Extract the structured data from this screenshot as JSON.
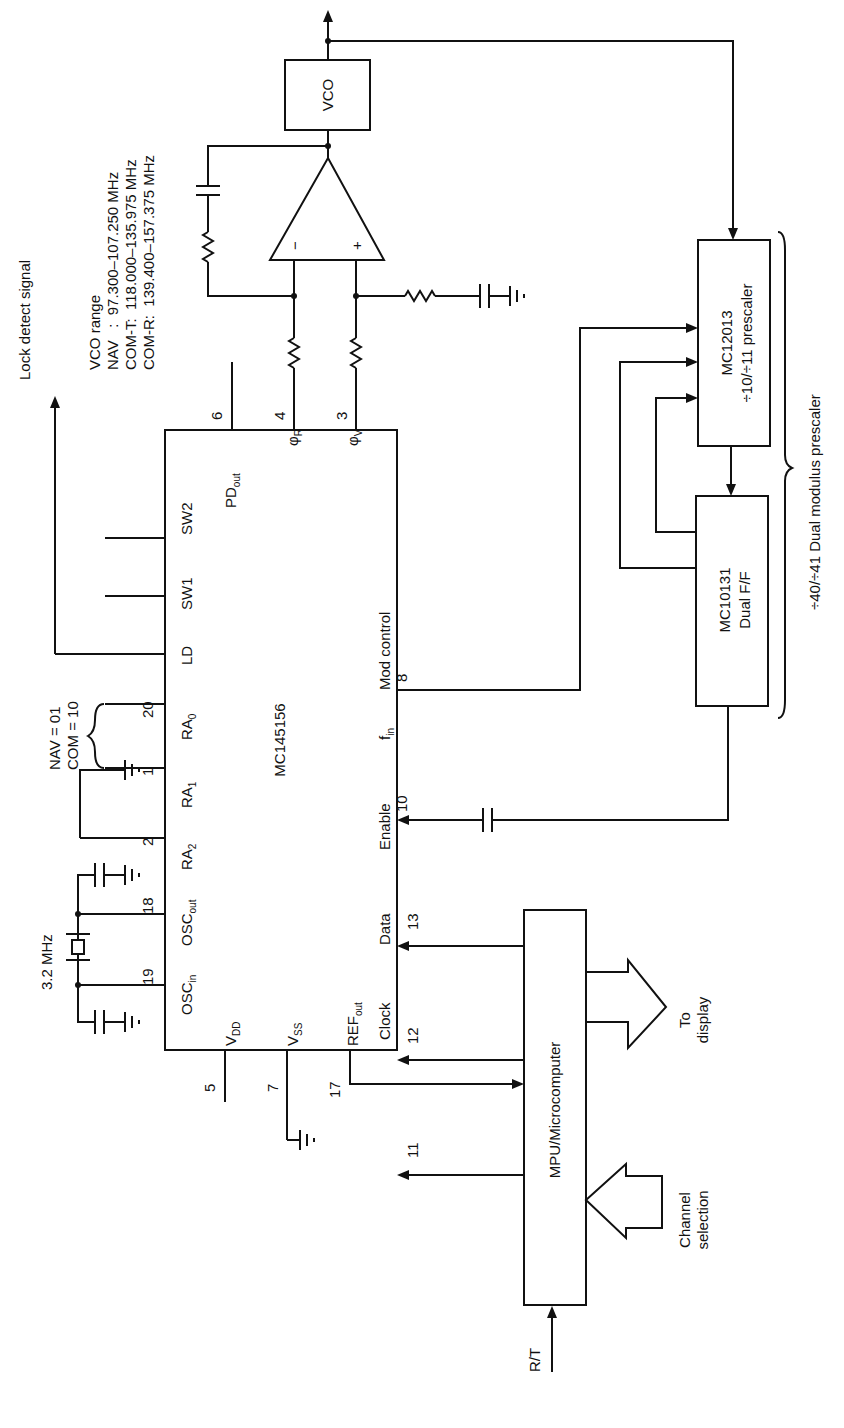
{
  "vco_range": {
    "title": "VCO range",
    "nav": "NAV   :  97.300–107.250 MHz",
    "com_t": "COM-T:  118.000–135.975 MHz",
    "com_r": "COM-R:  139.400–157.375 MHz"
  },
  "main_chip": {
    "name": "MC145156",
    "pins": {
      "osc_in": "OSC",
      "osc_in_sub": "in",
      "osc_in_num": "19",
      "osc_out": "OSC",
      "osc_out_sub": "out",
      "osc_out_num": "18",
      "ra2": "RA",
      "ra2_sub": "2",
      "ra2_num": "2",
      "ra1": "RA",
      "ra1_sub": "1",
      "ra1_num": "1",
      "ra0": "RA",
      "ra0_sub": "0",
      "ra0_num": "20",
      "ld": "LD",
      "sw1": "SW1",
      "sw2": "SW2",
      "pd_out": "PD",
      "pd_out_sub": "out",
      "pd_out_num": "6",
      "phi_r": "φ",
      "phi_r_sub": "R",
      "phi_r_num": "4",
      "phi_v": "φ",
      "phi_v_sub": "V",
      "phi_v_num": "3",
      "vdd": "V",
      "vdd_sub": "DD",
      "vdd_num": "5",
      "vss": "V",
      "vss_sub": "SS",
      "vss_num": "7",
      "ref_out": "REF",
      "ref_out_sub": "out",
      "ref_out_num": "17",
      "clock": "Clock",
      "clock_num": "11",
      "data": "Data",
      "data_num": "12",
      "enable": "Enable",
      "enable_num": "13",
      "fin": "f",
      "fin_sub": "in",
      "fin_num": "10",
      "mod_control": "Mod control",
      "mod_control_num": "8"
    }
  },
  "crystal_label": "3.2 MHz",
  "ra_code": {
    "nav": "NAV = 01",
    "com": "COM = 10"
  },
  "lock_detect": "Lock detect signal",
  "opamp": {
    "minus": "−",
    "plus": "+"
  },
  "vco_label": "VCO",
  "prescaler": {
    "name": "MC12013",
    "desc": "÷10/÷11 prescaler"
  },
  "flipflop": {
    "name": "MC10131",
    "desc": "Dual F/F"
  },
  "dual_modulus": "÷40/÷41 Dual modulus prescaler",
  "mpu": {
    "label": "MPU/Microcomputer"
  },
  "to_display": {
    "line1": "To",
    "line2": "display"
  },
  "channel_selection": {
    "line1": "Channel",
    "line2": "selection"
  },
  "rt_label": "R/T"
}
